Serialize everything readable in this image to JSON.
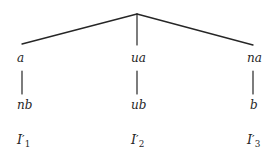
{
  "diagram": {
    "type": "tree",
    "colors": {
      "background": "#ffffff",
      "stroke": "#262626",
      "text": "#262626"
    },
    "apex": {
      "x": 137,
      "y": 14
    },
    "branches": [
      {
        "id": "left",
        "edge_end": {
          "x": 22,
          "y": 44
        },
        "level_one": "a",
        "level_two": "nb",
        "level_three_base": "I",
        "level_three_prime": "′",
        "level_three_subscript": "1"
      },
      {
        "id": "middle",
        "edge_end": {
          "x": 137,
          "y": 44
        },
        "level_one": "ua",
        "level_two": "ub",
        "level_three_base": "I",
        "level_three_prime": "′",
        "level_three_subscript": "2"
      },
      {
        "id": "right",
        "edge_end": {
          "x": 253,
          "y": 45
        },
        "level_one": "na",
        "level_two": "b",
        "level_three_base": "I",
        "level_three_prime": "′",
        "level_three_subscript": "3"
      }
    ]
  }
}
